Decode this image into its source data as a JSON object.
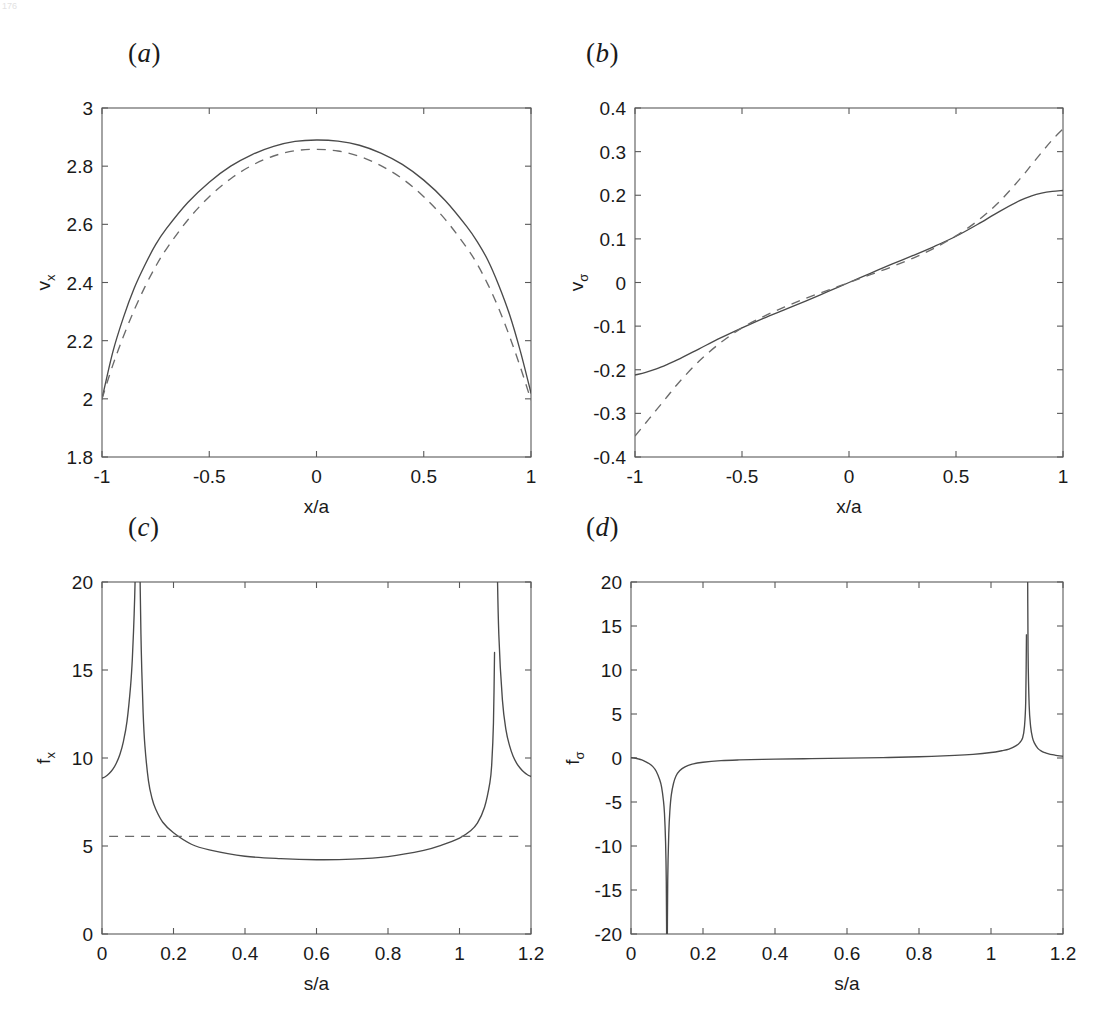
{
  "figure": {
    "background": "#ffffff",
    "line_color": "#4a4a4a",
    "dash_color": "#6b6b6b",
    "axis_color": "#595959",
    "corner_mark": "176"
  },
  "panels": [
    {
      "id": "a",
      "label_open": "(",
      "label_letter": "a",
      "label_close": ")",
      "box": {
        "left": 102,
        "top": 108,
        "right": 531,
        "bottom": 457
      },
      "label_pos": {
        "left": 128,
        "top": 38
      }
    },
    {
      "id": "b",
      "label_open": "(",
      "label_letter": "b",
      "label_close": ")",
      "box": {
        "left": 635,
        "top": 108,
        "right": 1063,
        "bottom": 457
      },
      "label_pos": {
        "left": 586,
        "top": 38
      }
    },
    {
      "id": "c",
      "label_open": "(",
      "label_letter": "c",
      "label_close": ")",
      "box": {
        "left": 102,
        "top": 582,
        "right": 531,
        "bottom": 934
      },
      "label_pos": {
        "left": 128,
        "top": 512
      }
    },
    {
      "id": "d",
      "label_open": "(",
      "label_letter": "d",
      "label_close": ")",
      "box": {
        "left": 631,
        "top": 582,
        "right": 1063,
        "bottom": 934
      },
      "label_pos": {
        "left": 586,
        "top": 512
      }
    }
  ],
  "chart_data": [
    {
      "panel": "a",
      "type": "line",
      "title": "(a)",
      "xlabel": "x/a",
      "ylabel_base": "v",
      "ylabel_sub": "x",
      "xlim": [
        -1,
        1
      ],
      "ylim": [
        1.8,
        3
      ],
      "xticks": [
        -1,
        -0.5,
        0,
        0.5,
        1
      ],
      "xticklabels": [
        "-1",
        "-0.5",
        "0",
        "0.5",
        "1"
      ],
      "yticks": [
        1.8,
        2,
        2.2,
        2.4,
        2.6,
        2.8,
        3
      ],
      "yticklabels": [
        "1.8",
        "2",
        "2.2",
        "2.4",
        "2.6",
        "2.8",
        "3"
      ],
      "grid": false,
      "legend": "none",
      "series": [
        {
          "name": "solid",
          "style": "solid",
          "x": [
            -1,
            -0.95,
            -0.9,
            -0.85,
            -0.8,
            -0.75,
            -0.7,
            -0.6,
            -0.5,
            -0.4,
            -0.3,
            -0.2,
            -0.1,
            0,
            0.1,
            0.2,
            0.3,
            0.4,
            0.5,
            0.6,
            0.7,
            0.75,
            0.8,
            0.85,
            0.9,
            0.95,
            1
          ],
          "y": [
            2.0,
            2.16,
            2.28,
            2.38,
            2.46,
            2.53,
            2.585,
            2.675,
            2.745,
            2.8,
            2.84,
            2.868,
            2.885,
            2.89,
            2.886,
            2.872,
            2.845,
            2.806,
            2.752,
            2.682,
            2.593,
            2.54,
            2.475,
            2.39,
            2.29,
            2.165,
            2.02
          ]
        },
        {
          "name": "dashed",
          "style": "dashed",
          "x": [
            -1,
            -0.95,
            -0.9,
            -0.85,
            -0.8,
            -0.75,
            -0.7,
            -0.6,
            -0.5,
            -0.4,
            -0.3,
            -0.2,
            -0.1,
            0,
            0.1,
            0.2,
            0.3,
            0.4,
            0.5,
            0.6,
            0.7,
            0.75,
            0.8,
            0.85,
            0.9,
            0.95,
            1
          ],
          "y": [
            2.0,
            2.115,
            2.215,
            2.305,
            2.385,
            2.455,
            2.515,
            2.615,
            2.695,
            2.757,
            2.803,
            2.835,
            2.853,
            2.858,
            2.852,
            2.834,
            2.802,
            2.757,
            2.695,
            2.617,
            2.52,
            2.462,
            2.392,
            2.31,
            2.215,
            2.11,
            1.995
          ]
        }
      ]
    },
    {
      "panel": "b",
      "type": "line",
      "title": "(b)",
      "xlabel": "x/a",
      "ylabel_base": "v",
      "ylabel_sub": "σ",
      "xlim": [
        -1,
        1
      ],
      "ylim": [
        -0.4,
        0.4
      ],
      "xticks": [
        -1,
        -0.5,
        0,
        0.5,
        1
      ],
      "xticklabels": [
        "-1",
        "-0.5",
        "0",
        "0.5",
        "1"
      ],
      "yticks": [
        -0.4,
        -0.3,
        -0.2,
        -0.1,
        0,
        0.1,
        0.2,
        0.3,
        0.4
      ],
      "yticklabels": [
        "-0.4",
        "-0.3",
        "-0.2",
        "-0.1",
        "0",
        "0.1",
        "0.2",
        "0.3",
        "0.4"
      ],
      "grid": false,
      "legend": "none",
      "series": [
        {
          "name": "solid",
          "style": "solid",
          "x": [
            -1,
            -0.95,
            -0.9,
            -0.85,
            -0.8,
            -0.7,
            -0.6,
            -0.5,
            -0.4,
            -0.3,
            -0.2,
            -0.1,
            0,
            0.1,
            0.2,
            0.3,
            0.4,
            0.5,
            0.6,
            0.7,
            0.8,
            0.85,
            0.9,
            0.95,
            1
          ],
          "y": [
            -0.212,
            -0.206,
            -0.198,
            -0.188,
            -0.177,
            -0.152,
            -0.127,
            -0.104,
            -0.082,
            -0.062,
            -0.042,
            -0.021,
            0.0,
            0.021,
            0.042,
            0.062,
            0.083,
            0.106,
            0.133,
            0.162,
            0.188,
            0.198,
            0.205,
            0.209,
            0.211
          ]
        },
        {
          "name": "dashed",
          "style": "dashed",
          "x": [
            -1,
            -0.95,
            -0.9,
            -0.85,
            -0.8,
            -0.7,
            -0.6,
            -0.5,
            -0.4,
            -0.3,
            -0.2,
            -0.1,
            0,
            0.1,
            0.2,
            0.3,
            0.4,
            0.5,
            0.6,
            0.7,
            0.8,
            0.85,
            0.9,
            0.95,
            1
          ],
          "y": [
            -0.352,
            -0.322,
            -0.292,
            -0.262,
            -0.232,
            -0.18,
            -0.138,
            -0.104,
            -0.078,
            -0.056,
            -0.036,
            -0.018,
            0.0,
            0.018,
            0.036,
            0.056,
            0.079,
            0.107,
            0.141,
            0.184,
            0.238,
            0.268,
            0.298,
            0.327,
            0.352
          ]
        }
      ]
    },
    {
      "panel": "c",
      "type": "line",
      "title": "(c)",
      "xlabel": "s/a",
      "ylabel_base": "f",
      "ylabel_sub": "x",
      "xlim": [
        0,
        1.2
      ],
      "ylim": [
        0,
        20
      ],
      "xticks": [
        0,
        0.2,
        0.4,
        0.6,
        0.8,
        1,
        1.2
      ],
      "xticklabels": [
        "0",
        "0.2",
        "0.4",
        "0.6",
        "0.8",
        "1",
        "1.2"
      ],
      "yticks": [
        0,
        5,
        10,
        15,
        20
      ],
      "yticklabels": [
        "0",
        "5",
        "10",
        "15",
        "20"
      ],
      "grid": false,
      "legend": "none",
      "asymptotes": [
        0.1,
        1.1
      ],
      "reference_level": 5.55,
      "minimum_value": 4.2,
      "series": [
        {
          "name": "solid-left",
          "style": "solid",
          "x": [
            0,
            0.01,
            0.02,
            0.03,
            0.04,
            0.05,
            0.06,
            0.07,
            0.08,
            0.085,
            0.09,
            0.093,
            0.096,
            0.098
          ],
          "y": [
            8.85,
            8.95,
            9.12,
            9.35,
            9.7,
            10.2,
            10.95,
            12.1,
            14.1,
            15.7,
            18.2,
            20.5,
            24.5,
            30.0
          ]
        },
        {
          "name": "solid-main",
          "style": "solid",
          "x": [
            0.102,
            0.104,
            0.107,
            0.11,
            0.115,
            0.12,
            0.13,
            0.14,
            0.15,
            0.17,
            0.2,
            0.25,
            0.3,
            0.4,
            0.5,
            0.6,
            0.7,
            0.8,
            0.9,
            0.95,
            1.0,
            1.03,
            1.05,
            1.07,
            1.085,
            1.09,
            1.095,
            1.098
          ],
          "y": [
            30.0,
            24.5,
            19.5,
            16.0,
            12.6,
            10.7,
            8.7,
            7.7,
            7.1,
            6.35,
            5.75,
            5.1,
            4.78,
            4.42,
            4.28,
            4.22,
            4.25,
            4.4,
            4.75,
            5.05,
            5.45,
            5.85,
            6.3,
            7.2,
            8.6,
            9.6,
            12.0,
            16.0
          ]
        },
        {
          "name": "solid-right",
          "style": "solid",
          "x": [
            1.102,
            1.105,
            1.11,
            1.12,
            1.13,
            1.14,
            1.15,
            1.16,
            1.17,
            1.18,
            1.19,
            1.2
          ],
          "y": [
            30.0,
            22.0,
            17.0,
            13.3,
            11.6,
            10.7,
            10.1,
            9.7,
            9.42,
            9.2,
            9.05,
            8.95
          ]
        },
        {
          "name": "dashed-reference",
          "style": "dashed",
          "x": [
            0.02,
            1.18
          ],
          "y": [
            5.55,
            5.55
          ]
        }
      ]
    },
    {
      "panel": "d",
      "type": "line",
      "title": "(d)",
      "xlabel": "s/a",
      "ylabel_base": "f",
      "ylabel_sub": "σ",
      "xlim": [
        0,
        1.2
      ],
      "ylim": [
        -20,
        20
      ],
      "xticks": [
        0,
        0.2,
        0.4,
        0.6,
        0.8,
        1,
        1.2
      ],
      "xticklabels": [
        "0",
        "0.2",
        "0.4",
        "0.6",
        "0.8",
        "1",
        "1.2"
      ],
      "yticks": [
        -20,
        -15,
        -10,
        -5,
        0,
        5,
        10,
        15,
        20
      ],
      "yticklabels": [
        "-20",
        "-15",
        "-10",
        "-5",
        "0",
        "5",
        "10",
        "15",
        "20"
      ],
      "grid": false,
      "legend": "none",
      "asymptotes": [
        0.1,
        1.1
      ],
      "series": [
        {
          "name": "solid-left",
          "style": "solid",
          "x": [
            0,
            0.01,
            0.02,
            0.03,
            0.04,
            0.05,
            0.06,
            0.07,
            0.08,
            0.085,
            0.09,
            0.093,
            0.096,
            0.098,
            0.0995
          ],
          "y": [
            0.05,
            0.0,
            -0.1,
            -0.22,
            -0.4,
            -0.62,
            -0.95,
            -1.5,
            -2.5,
            -3.3,
            -4.8,
            -6.3,
            -9.5,
            -14.0,
            -24.0
          ]
        },
        {
          "name": "solid-main",
          "style": "solid",
          "x": [
            0.1005,
            0.102,
            0.105,
            0.108,
            0.112,
            0.118,
            0.125,
            0.135,
            0.15,
            0.17,
            0.2,
            0.25,
            0.3,
            0.4,
            0.5,
            0.6,
            0.7,
            0.8,
            0.9,
            0.95,
            1.0,
            1.03,
            1.05,
            1.07,
            1.08,
            1.088,
            1.093,
            1.0965,
            1.0985
          ],
          "y": [
            -24.0,
            -14.0,
            -8.5,
            -6.0,
            -4.2,
            -2.9,
            -2.05,
            -1.45,
            -1.0,
            -0.7,
            -0.48,
            -0.3,
            -0.22,
            -0.13,
            -0.07,
            -0.02,
            0.05,
            0.14,
            0.3,
            0.42,
            0.62,
            0.82,
            1.0,
            1.4,
            1.75,
            2.3,
            3.6,
            6.5,
            14.0
          ]
        },
        {
          "name": "solid-right",
          "style": "solid",
          "x": [
            1.1015,
            1.103,
            1.106,
            1.11,
            1.115,
            1.12,
            1.13,
            1.14,
            1.15,
            1.16,
            1.17,
            1.18,
            1.19,
            1.2
          ],
          "y": [
            24.0,
            12.0,
            6.0,
            3.6,
            2.35,
            1.75,
            1.1,
            0.78,
            0.6,
            0.48,
            0.38,
            0.3,
            0.24,
            0.2
          ]
        }
      ]
    }
  ]
}
